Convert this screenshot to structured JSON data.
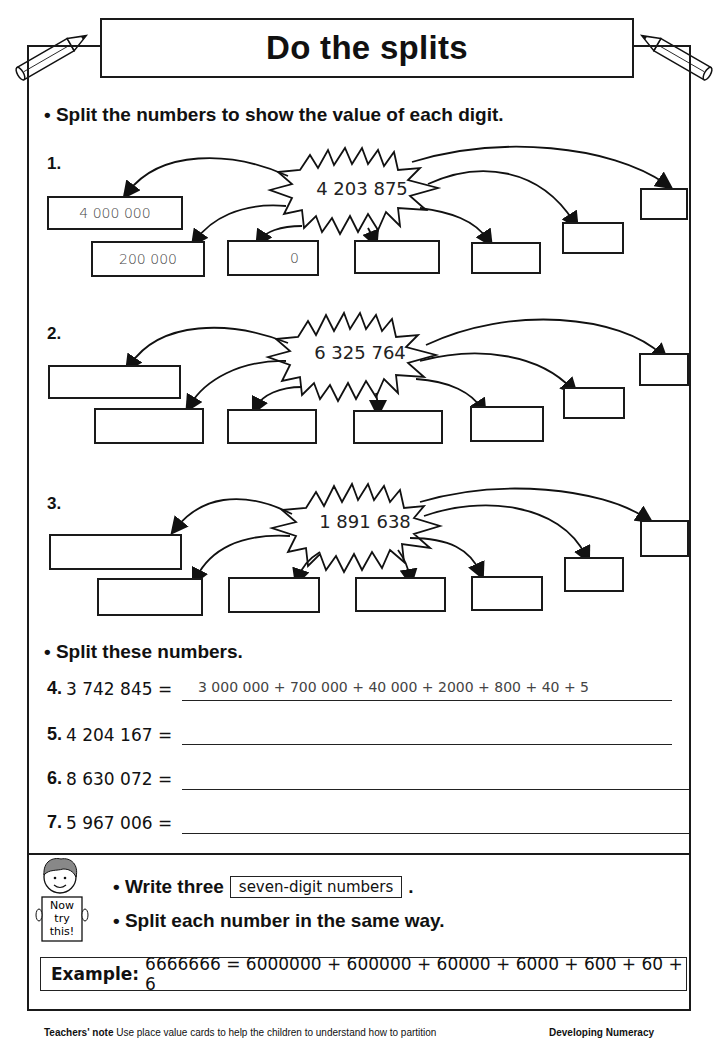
{
  "header": {
    "title": "Do the splits"
  },
  "section1": {
    "instruction": "• Split the numbers to show the value of each digit.",
    "problems": [
      {
        "label": "1.",
        "number": "4 203 875",
        "boxes": [
          "4 000 000",
          "200 000",
          "0",
          "",
          "",
          "",
          ""
        ]
      },
      {
        "label": "2.",
        "number": "6 325 764",
        "boxes": [
          "",
          "",
          "",
          "",
          "",
          "",
          ""
        ]
      },
      {
        "label": "3.",
        "number": "1 891 638",
        "boxes": [
          "",
          "",
          "",
          "",
          "",
          "",
          ""
        ]
      }
    ]
  },
  "section2": {
    "instruction": "• Split these numbers.",
    "rows": [
      {
        "label": "4.",
        "number": "3 742 845 =",
        "answer": "3 000 000 + 700 000 + 40 000 + 2000 + 800 + 40 + 5"
      },
      {
        "label": "5.",
        "number": "4 204 167 =",
        "answer": ""
      },
      {
        "label": "6.",
        "number": "8 630 072 =",
        "answer": ""
      },
      {
        "label": "7.",
        "number": "5 967 006 =",
        "answer": ""
      }
    ]
  },
  "now_try_this": {
    "sign_text": [
      "Now",
      "try",
      "this!"
    ],
    "line1_prefix": "• Write three",
    "line1_boxed": "seven-digit numbers",
    "line1_suffix": ".",
    "line2": "• Split each number in the same way.",
    "example_label": "Example:",
    "example_text": "6666666 = 6000000 + 600000 + 60000 + 6000 + 600 + 60 + 6"
  },
  "footer": {
    "note_label": "Teachers' note",
    "note_text": "Use place value cards to help the children to understand how to partition",
    "series": "Developing Numeracy"
  }
}
